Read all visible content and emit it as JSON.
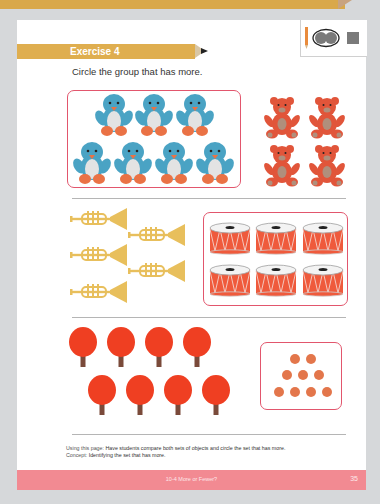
{
  "exercise": {
    "title": "Exercise 4",
    "instruction": "Circle the group that has more."
  },
  "legend": {
    "icons": [
      "pencil-icon",
      "circled-dots-icon",
      "square-icon"
    ]
  },
  "groups": [
    {
      "row": 1,
      "left": {
        "object": "penguin",
        "count": 7,
        "circled": true
      },
      "right": {
        "object": "teddy-bear",
        "count": 4,
        "circled": false
      }
    },
    {
      "row": 2,
      "left": {
        "object": "trumpet",
        "count": 5,
        "circled": false
      },
      "right": {
        "object": "drum",
        "count": 6,
        "circled": true
      }
    },
    {
      "row": 3,
      "left": {
        "object": "ping-pong-paddle",
        "count": 8,
        "circled": false
      },
      "right": {
        "object": "ball",
        "count": 9,
        "circled": true
      }
    }
  ],
  "notes": {
    "using_label": "Using this page:",
    "using_text": "Have students compare both sets of objects and circle the set that has more.",
    "concept_label": "Concept:",
    "concept_text": "Identifying the set that has more."
  },
  "footer": {
    "title": "10-4 More or Fewer?",
    "page": "35"
  },
  "colors": {
    "accent_gold": "#dfae4f",
    "circle_pink": "#e2566d",
    "footer_pink": "#f28a92",
    "penguin_blue": "#4aa3c4",
    "bear_orange": "#e1553a",
    "drum_red": "#ef5a3c",
    "trumpet_gold": "#e8bf5c",
    "paddle_red": "#ef3f22",
    "ball_orange": "#e3764b"
  }
}
